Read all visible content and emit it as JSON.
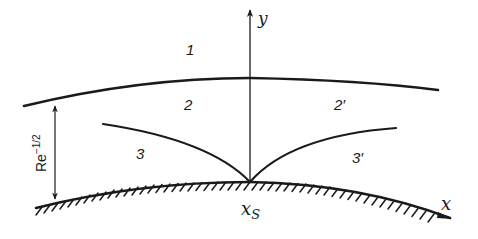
{
  "diagram": {
    "type": "boundary-layer regions near separation point",
    "axes": {
      "x_label": "x",
      "y_label": "y"
    },
    "separation_point_label": "x",
    "separation_point_subscript": "S",
    "thickness_label_base": "Re",
    "thickness_label_exponent": "−1/2",
    "regions": [
      {
        "id": "1",
        "label": "1"
      },
      {
        "id": "2",
        "label": "2"
      },
      {
        "id": "2p",
        "label": "2′"
      },
      {
        "id": "3",
        "label": "3"
      },
      {
        "id": "3p",
        "label": "3′"
      }
    ],
    "colors": {
      "ink": "#1a1a1a",
      "background": "#ffffff"
    }
  }
}
